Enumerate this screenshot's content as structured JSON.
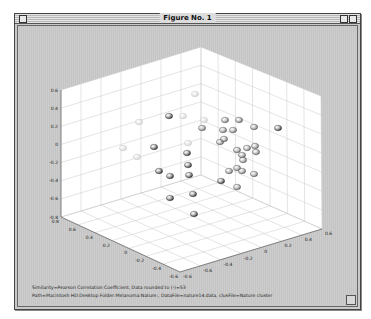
{
  "window": {
    "title": "Figure No. 1"
  },
  "captions": {
    "line1": "Similarity=Pearson Correlation Coefficient, Data rounded to (-)=53",
    "line2": "Path=Macintosh HD:Desktop Folder:Melanoma:Nature:, DataFile=nature14.data, clusFile=Nature cluster"
  },
  "chart_data": {
    "type": "scatter",
    "title": "",
    "dimensions": 3,
    "xlabel": "",
    "ylabel": "",
    "zlabel": "",
    "x_ticks": [
      "0.8",
      "0.6",
      "0.4",
      "0.2",
      "0",
      "-0.2",
      "-0.4",
      "-0.6"
    ],
    "y_ticks": [
      "-0.6",
      "-0.6",
      "-0.4",
      "-0.2",
      "0",
      "0.2",
      "0.4",
      "0.6"
    ],
    "z_ticks": [
      "0.6",
      "0.4",
      "0.2",
      "0",
      "-0.2",
      "-0.4",
      "-0.6",
      "-0.8"
    ],
    "xlim": [
      -0.6,
      0.8
    ],
    "ylim": [
      -0.6,
      0.6
    ],
    "zlim": [
      -0.8,
      0.6
    ],
    "grid": true,
    "legend": null,
    "series": [
      {
        "name": "cluster-light",
        "color": "#d8d8d8",
        "points_screen": [
          [
            193,
            92
          ],
          [
            181,
            114
          ],
          [
            137,
            120
          ],
          [
            202,
            118
          ],
          [
            121,
            146
          ],
          [
            186,
            141
          ],
          [
            135,
            155
          ]
        ]
      },
      {
        "name": "cluster-dark",
        "color": "#222222",
        "points_screen": [
          [
            167,
            114
          ],
          [
            152,
            145
          ],
          [
            185,
            151
          ],
          [
            186,
            163
          ],
          [
            157,
            169
          ],
          [
            168,
            174
          ],
          [
            187,
            173
          ],
          [
            168,
            196
          ],
          [
            191,
            192
          ],
          [
            192,
            212
          ],
          [
            276,
            126
          ],
          [
            219,
            179
          ]
        ]
      },
      {
        "name": "cluster-mid",
        "color": "#707070",
        "points_screen": [
          [
            223,
            118
          ],
          [
            237,
            118
          ],
          [
            200,
            126
          ],
          [
            221,
            128
          ],
          [
            231,
            128
          ],
          [
            252,
            125
          ],
          [
            218,
            140
          ],
          [
            222,
            137
          ],
          [
            235,
            148
          ],
          [
            245,
            146
          ],
          [
            254,
            150
          ],
          [
            240,
            153
          ],
          [
            241,
            158
          ],
          [
            253,
            144
          ],
          [
            235,
            166
          ],
          [
            227,
            169
          ],
          [
            240,
            169
          ],
          [
            252,
            172
          ],
          [
            235,
            185
          ]
        ]
      }
    ]
  }
}
